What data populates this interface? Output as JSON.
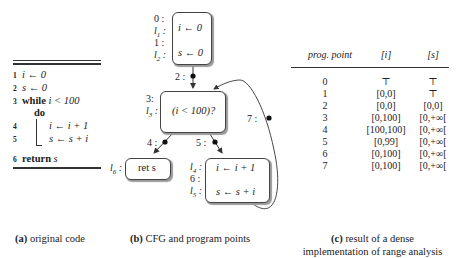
{
  "panel_a": {
    "caption_tag": "(a)",
    "caption_text": " original code",
    "lines": [
      {
        "num": "1",
        "text": "i ← 0"
      },
      {
        "num": "2",
        "text": "s ← 0"
      },
      {
        "num": "3",
        "keyword": "while",
        "text": " i < 100"
      },
      {
        "num": "",
        "keyword": "do",
        "text": ""
      },
      {
        "num": "4",
        "text": "i ← i + 1"
      },
      {
        "num": "5",
        "text": "s ← s + i"
      },
      {
        "num": "6",
        "keyword": "return",
        "text": " s"
      }
    ]
  },
  "panel_b": {
    "caption_tag": "(b)",
    "caption_text": " CFG and program points",
    "nodes": {
      "entry": {
        "line1": "i ← 0",
        "line2": "s ← 0",
        "labels": [
          "0 :",
          "l1 :",
          "1 :",
          "l2 :"
        ]
      },
      "cond": {
        "text": "(i < 100)?",
        "labels": [
          "3:",
          "l3 :"
        ]
      },
      "ret": {
        "text": "ret s",
        "label": "l6 :"
      },
      "body": {
        "line1": "i ← i + 1",
        "line2": "s ← s + i",
        "labels": [
          "l4 :",
          "6 :",
          "l5 :"
        ]
      }
    },
    "edge_points": {
      "p2": "2 :",
      "p4": "4 :",
      "p5": "5 :",
      "p7": "7 :"
    }
  },
  "panel_c": {
    "caption_tag": "(c)",
    "caption_line1": " result of  a dense",
    "caption_line2": "implementation of range analysis",
    "headers": [
      "prog. point",
      "[i]",
      "[s]"
    ],
    "rows": [
      [
        "0",
        "⊤",
        "⊤"
      ],
      [
        "1",
        "[0,0]",
        "⊤"
      ],
      [
        "2",
        "[0,0]",
        "[0,0]"
      ],
      [
        "3",
        "[0,100]",
        "[0,+∞["
      ],
      [
        "4",
        "[100,100]",
        "[0,+∞["
      ],
      [
        "5",
        "[0,99]",
        "[0,+∞["
      ],
      [
        "6",
        "[0,100]",
        "[0,+∞["
      ],
      [
        "7",
        "[0,100]",
        "[0,+∞["
      ]
    ]
  }
}
